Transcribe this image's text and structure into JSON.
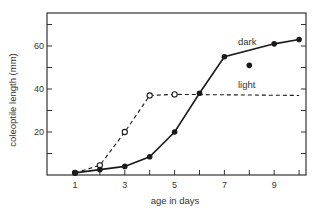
{
  "chart_data": {
    "type": "line",
    "title": "",
    "xlabel": "age in days",
    "ylabel": "coleoptile length (mm)",
    "xlim": [
      0,
      10.3
    ],
    "ylim": [
      0,
      75
    ],
    "x_ticks": [
      1,
      2,
      3,
      4,
      5,
      6,
      7,
      8,
      9,
      10
    ],
    "x_tick_labels": [
      "1",
      "3",
      "5",
      "7",
      "9"
    ],
    "x_tick_label_values": [
      1,
      3,
      5,
      7,
      9
    ],
    "y_ticks": [
      10,
      20,
      30,
      40,
      50,
      60,
      70
    ],
    "y_tick_labels": [
      "20",
      "40",
      "60"
    ],
    "y_tick_label_values": [
      20,
      40,
      60
    ],
    "grid": false,
    "legend": "inline labels",
    "series": [
      {
        "name": "dark",
        "style": "solid line, filled circles",
        "x": [
          1,
          2,
          3,
          4,
          5,
          6,
          7,
          9,
          10
        ],
        "values": [
          1,
          2.5,
          4,
          8.5,
          20,
          38,
          55,
          61,
          63
        ]
      },
      {
        "name": "dark (isolated point)",
        "style": "filled circle, unconnected",
        "x": [
          8
        ],
        "values": [
          51
        ]
      },
      {
        "name": "light",
        "style": "dashed line, open circles",
        "x": [
          1,
          2,
          3,
          4,
          5,
          10
        ],
        "values": [
          1,
          4.5,
          20,
          37,
          37.5,
          37
        ],
        "markers_at": [
          1,
          2,
          3,
          4,
          5
        ]
      }
    ],
    "annotations": [
      {
        "text": "dark",
        "x": 8,
        "y": 66
      },
      {
        "text": "light",
        "x": 8,
        "y": 42
      }
    ]
  },
  "labels": {
    "xlabel": "age in days",
    "ylabel": "coleoptile length (mm)",
    "dark": "dark",
    "light": "light"
  },
  "colors": {
    "line": "#1a1a1a",
    "axis": "#333333",
    "background": "#ffffff"
  }
}
